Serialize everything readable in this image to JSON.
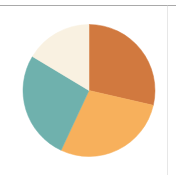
{
  "figure": {
    "background_color": "#ffffff",
    "width": 176,
    "height": 175,
    "top_rule_color": "#9a9a9a",
    "right_rule_color": "#c9c9c9"
  },
  "chart_data": {
    "type": "pie",
    "title": "",
    "subtitle": "",
    "xlabel": "",
    "ylabel": "",
    "legend": false,
    "legend_position": "none",
    "grid": false,
    "labels_shown": false,
    "start_angle_deg": 0,
    "direction": "clockwise",
    "center_x": 89,
    "center_y": 90.5,
    "radius": 66,
    "categories": [
      "Slice 1",
      "Slice 2",
      "Slice 3",
      "Slice 4"
    ],
    "values": [
      28.5,
      28.5,
      26.5,
      16.5
    ],
    "colors": [
      "#d1793f",
      "#f7b05c",
      "#6fb1ad",
      "#f9f1e1"
    ],
    "slices": [
      {
        "name": "Slice 1",
        "value": 28.5,
        "color": "#d1793f",
        "start_angle_deg": 0,
        "end_angle_deg": 103,
        "color_name": "dark-orange"
      },
      {
        "name": "Slice 2",
        "value": 28.5,
        "color": "#f7b05c",
        "start_angle_deg": 103,
        "end_angle_deg": 205,
        "color_name": "light-orange"
      },
      {
        "name": "Slice 3",
        "value": 26.5,
        "color": "#6fb1ad",
        "start_angle_deg": 205,
        "end_angle_deg": 301,
        "color_name": "teal"
      },
      {
        "name": "Slice 4",
        "value": 16.5,
        "color": "#f9f1e1",
        "start_angle_deg": 301,
        "end_angle_deg": 360,
        "color_name": "cream"
      }
    ]
  }
}
